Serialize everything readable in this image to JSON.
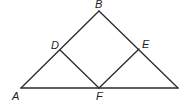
{
  "diagram": {
    "type": "geometry",
    "points": {
      "A": {
        "label": "A",
        "x": 21,
        "y": 88
      },
      "B": {
        "label": "B",
        "x": 99,
        "y": 11
      },
      "C": {
        "label": "",
        "x": 178,
        "y": 88
      },
      "D": {
        "label": "D",
        "x": 60,
        "y": 50
      },
      "E": {
        "label": "E",
        "x": 139,
        "y": 49
      },
      "F": {
        "label": "F",
        "x": 99,
        "y": 88
      }
    },
    "segments": [
      [
        "A",
        "B"
      ],
      [
        "B",
        "C"
      ],
      [
        "A",
        "C"
      ],
      [
        "D",
        "F"
      ],
      [
        "E",
        "F"
      ]
    ],
    "labels": {
      "A": "A",
      "B": "B",
      "D": "D",
      "E": "E",
      "F": "F"
    },
    "stroke_color": "#2a2a2a"
  }
}
